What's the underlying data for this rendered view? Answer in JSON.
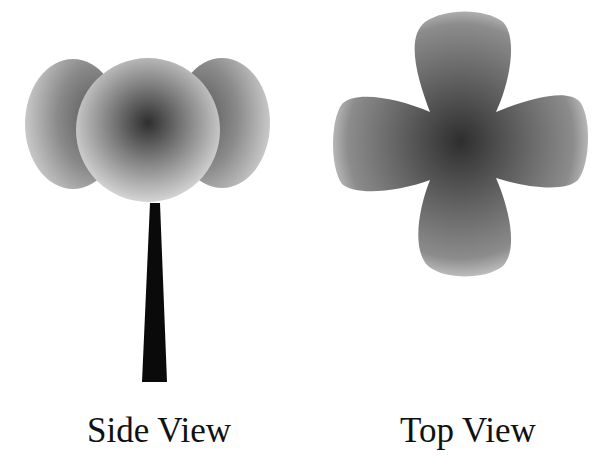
{
  "diagram": {
    "panels": [
      {
        "id": "side",
        "label": "Side View",
        "shapes": [
          "left-lobe-sphere",
          "right-lobe-sphere",
          "center-sphere",
          "stem"
        ]
      },
      {
        "id": "top",
        "label": "Top View",
        "shapes": [
          "four-petal-cloverleaf"
        ]
      }
    ],
    "colors": {
      "background": "#ffffff",
      "shade_dark": "#2e2e2e",
      "shade_mid": "#6e6e6e",
      "shade_light": "#cfcfcf",
      "stem": "#0a0a0a",
      "text": "#111111"
    }
  }
}
